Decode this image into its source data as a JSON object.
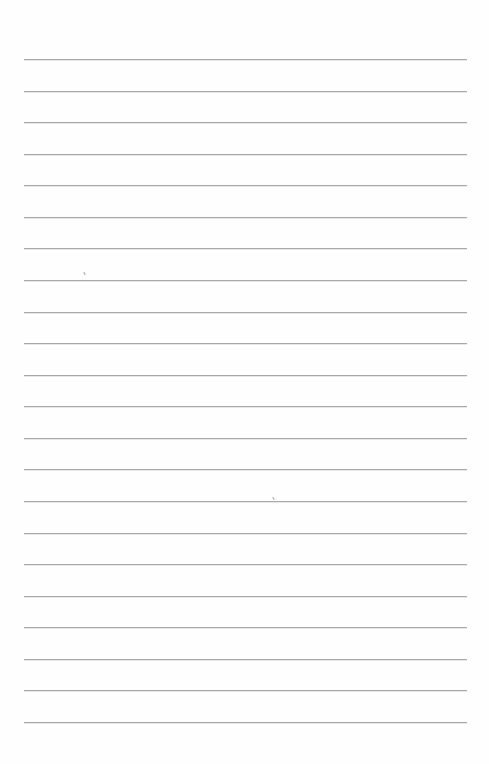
{
  "page": {
    "type": "lined-paper",
    "background_color": "#fefefe",
    "rule_color": "#a9a9a9",
    "rule_count": 22,
    "rule_left": 24,
    "rule_right": 467,
    "first_rule_y": 59,
    "last_rule_y": 722
  },
  "marks": [
    {
      "x": 84,
      "y": 272
    },
    {
      "x": 273,
      "y": 497
    }
  ]
}
